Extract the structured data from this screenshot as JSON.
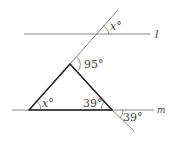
{
  "diagram": {
    "lines": {
      "l": {
        "label": "l"
      },
      "m": {
        "label": "m"
      }
    },
    "angles": {
      "top_x": "x°",
      "apex": "95°",
      "base_left": "x°",
      "base_right_inner": "39°",
      "base_right_outer": "39°"
    },
    "colors": {
      "line": "#555555",
      "triangle": "#222222"
    }
  }
}
